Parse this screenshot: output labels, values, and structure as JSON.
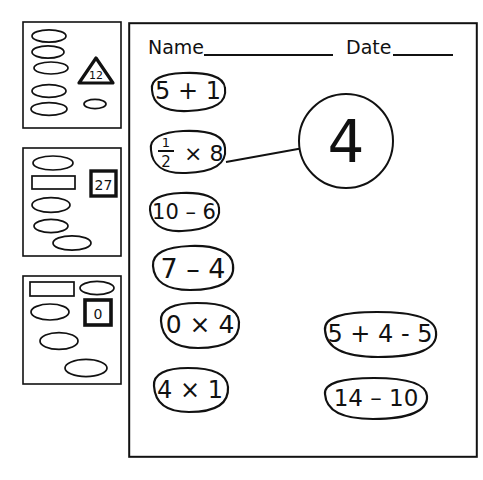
{
  "document": {
    "type": "scanned-math-worksheet",
    "ink_color": "#111111",
    "paper_color": "#ffffff"
  },
  "worksheet": {
    "header": {
      "name_label": "Name",
      "date_label": "Date",
      "name_value": "",
      "date_value": ""
    },
    "left_column_bubbles": [
      {
        "expression": "5 + 1"
      },
      {
        "expression": "1/2 × 8",
        "numerator": "1",
        "denominator": "2",
        "rest": "× 8"
      },
      {
        "expression": "10 – 6"
      },
      {
        "expression": "7 – 4"
      },
      {
        "expression": "0 × 4"
      },
      {
        "expression": "4 × 1"
      }
    ],
    "answer_circle": {
      "value": "4"
    },
    "right_column_bubbles": [
      {
        "expression": "5 + 4 - 5"
      },
      {
        "expression": "14 – 10"
      }
    ],
    "arrow": {
      "from": "1/2 × 8",
      "to": "4"
    }
  },
  "thumbnail_panels": [
    {
      "badge": {
        "shape": "triangle",
        "value": "12"
      },
      "marks": [
        "ellipse",
        "ellipse",
        "ellipse",
        "ellipse",
        "ellipse",
        "ellipse"
      ]
    },
    {
      "badge": {
        "shape": "square",
        "value": "27"
      },
      "marks": [
        "ellipse",
        "rectangle",
        "ellipse",
        "ellipse",
        "ellipse"
      ]
    },
    {
      "badge": {
        "shape": "square",
        "value": "0"
      },
      "marks": [
        "rectangle",
        "ellipse",
        "ellipse",
        "ellipse",
        "ellipse"
      ]
    }
  ]
}
